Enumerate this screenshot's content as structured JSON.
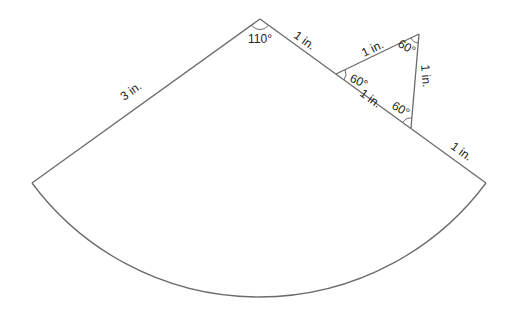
{
  "diagram": {
    "type": "geometry",
    "colors": {
      "stroke": "#6b6b6b",
      "text": "#222222",
      "background": "#ffffff"
    },
    "sector": {
      "central_angle_label": "110°",
      "left_radius_label": "3 in.",
      "right_radius_segments": [
        {
          "label": "1 in.",
          "position": "upper"
        },
        {
          "label": "1 in.",
          "position": "middle (shared with triangle)"
        },
        {
          "label": "1 in.",
          "position": "lower"
        }
      ]
    },
    "triangle": {
      "type": "equilateral",
      "side_labels": [
        "1 in.",
        "1 in.",
        "1 in."
      ],
      "angle_labels": [
        "60°",
        "60°",
        "60°"
      ]
    }
  },
  "labels": {
    "apex_angle": "110°",
    "left_side": "3 in.",
    "right_upper": "1 in.",
    "right_middle": "1 in.",
    "right_lower": "1 in.",
    "tri_top_side": "1 in.",
    "tri_right_side": "1 in.",
    "tri_angle_left": "60°",
    "tri_angle_top": "60°",
    "tri_angle_bottom": "60°"
  }
}
